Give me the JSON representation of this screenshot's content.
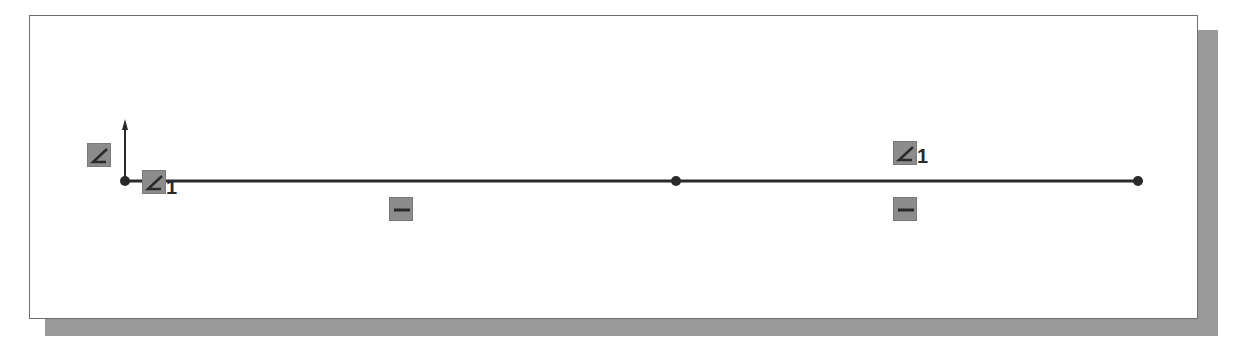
{
  "diagram": {
    "type": "sketch",
    "colors": {
      "line": "#2a2a2a",
      "point": "#2a2a2a",
      "icon_bg": "#8c8c8c",
      "icon_glyph": "#2a2a2a",
      "frame_border": "#6e6e6e",
      "shadow": "#9a9a9a"
    },
    "origin": {
      "x": 125,
      "y": 181
    },
    "line": {
      "x1": 125,
      "y1": 181,
      "x2": 1138,
      "y2": 181
    },
    "points": [
      {
        "name": "origin-point",
        "x": 125,
        "y": 181
      },
      {
        "name": "midpoint",
        "x": 676,
        "y": 181
      },
      {
        "name": "endpoint",
        "x": 1138,
        "y": 181
      }
    ],
    "relations": [
      {
        "kind": "coincident-icon",
        "x": 87,
        "y": 143,
        "index": ""
      },
      {
        "kind": "coincident-icon",
        "x": 142,
        "y": 170,
        "index": "1"
      },
      {
        "kind": "coincident-icon",
        "x": 893,
        "y": 141,
        "index": "1"
      },
      {
        "kind": "horizontal-icon",
        "x": 389,
        "y": 197,
        "index": ""
      },
      {
        "kind": "horizontal-icon",
        "x": 893,
        "y": 197,
        "index": ""
      }
    ],
    "labels": {
      "rel_index_origin": "1",
      "rel_index_right": "1"
    }
  }
}
